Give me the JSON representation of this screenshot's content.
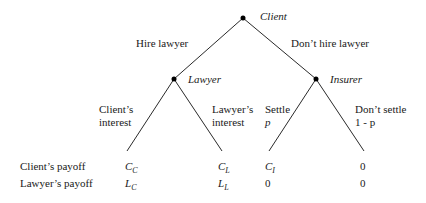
{
  "nodes": {
    "root": {
      "label": "Client"
    },
    "lawyer": {
      "label": "Lawyer"
    },
    "insurer": {
      "label": "Insurer"
    }
  },
  "edges": {
    "hire": {
      "label": "Hire lawyer"
    },
    "dont_hire": {
      "label": "Don’t hire lawyer"
    },
    "client_interest": {
      "line1": "Client’s",
      "line2": "interest"
    },
    "lawyer_interest": {
      "line1": "Lawyer’s",
      "line2": "interest"
    },
    "settle": {
      "line1": "Settle",
      "line2": "p"
    },
    "dont_settle": {
      "line1": "Don’t settle",
      "line2": "1 - p"
    }
  },
  "payoffs": {
    "row_labels": [
      "Client’s payoff",
      "Lawyer’s payoff"
    ],
    "leaves": [
      {
        "client": {
          "base": "C",
          "sub": "C"
        },
        "lawyer": {
          "base": "L",
          "sub": "C"
        }
      },
      {
        "client": {
          "base": "C",
          "sub": "L"
        },
        "lawyer": {
          "base": "L",
          "sub": "L"
        }
      },
      {
        "client": {
          "base": "C",
          "sub": "I"
        },
        "lawyer": {
          "base": "0",
          "sub": ""
        }
      },
      {
        "client": {
          "base": "0",
          "sub": ""
        },
        "lawyer": {
          "base": "0",
          "sub": ""
        }
      }
    ]
  }
}
